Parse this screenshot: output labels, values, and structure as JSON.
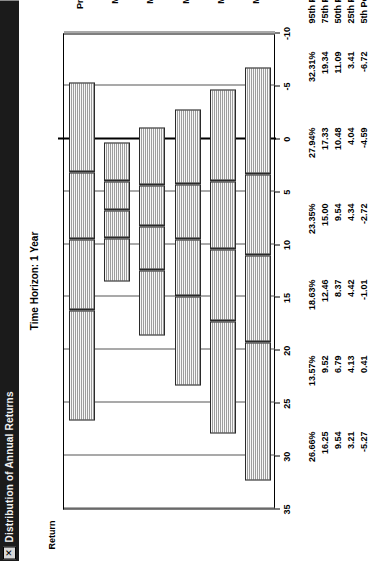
{
  "window": {
    "title": "Distribution of Annual Returns",
    "close_label": "✕",
    "close_icon": "close-icon"
  },
  "chart_data": {
    "type": "box",
    "title": "Time Horizon: 1 Year",
    "xlabel": "",
    "ylabel": "Return",
    "ylim": [
      -10,
      35
    ],
    "yticks": [
      "35",
      "30",
      "25",
      "20",
      "15",
      "10",
      "5",
      "0",
      "-5",
      "-10"
    ],
    "ytick_values": [
      35,
      30,
      25,
      20,
      15,
      10,
      5,
      0,
      -5,
      -10
    ],
    "grid": true,
    "legend": "none",
    "categories": [
      "Present",
      "Mix 1",
      "Mix 2",
      "Mix 3",
      "Mix 4",
      "Mix 5"
    ],
    "percentile_labels": [
      "95th Pctl",
      "75th Pctl",
      "50th Pctl",
      "25th Pctl",
      "5th Pctl"
    ],
    "series": [
      {
        "name": "95th Pctl",
        "values": [
          26.66,
          13.57,
          18.63,
          23.35,
          27.94,
          32.31
        ]
      },
      {
        "name": "75th Pctl",
        "values": [
          16.25,
          9.52,
          12.46,
          15.0,
          17.33,
          19.34
        ]
      },
      {
        "name": "50th Pctl",
        "values": [
          9.54,
          6.79,
          8.37,
          9.54,
          10.48,
          11.09
        ]
      },
      {
        "name": "25th Pctl",
        "values": [
          3.21,
          4.13,
          4.42,
          4.34,
          4.04,
          3.41
        ]
      },
      {
        "name": "5th Pctl",
        "values": [
          -5.27,
          0.41,
          -1.01,
          -2.72,
          -4.59,
          -6.72
        ]
      }
    ]
  },
  "table": {
    "columns": [
      "Present",
      "Mix 1",
      "Mix 2",
      "Mix 3",
      "Mix 4",
      "Mix 5"
    ],
    "row_labels": [
      "95th Pctl",
      "75th Pctl",
      "50th Pctl",
      "25th Pctl",
      "5th Pctl"
    ],
    "rows": [
      [
        "26.66%",
        "13.57%",
        "18.63%",
        "23.35%",
        "27.94%",
        "32.31%"
      ],
      [
        "16.25",
        "9.52",
        "12.46",
        "15.00",
        "17.33",
        "19.34"
      ],
      [
        "9.54",
        "6.79",
        "8.37",
        "9.54",
        "10.48",
        "11.09"
      ],
      [
        "3.21",
        "4.13",
        "4.42",
        "4.34",
        "4.04",
        "3.41"
      ],
      [
        "-5.27",
        "0.41",
        "-1.01",
        "-2.72",
        "-4.59",
        "-6.72"
      ]
    ]
  },
  "colors": {
    "titlebar_bg": "#1b1b1b",
    "box_fill": "#c9c9c9",
    "box_border": "#2a2a2a",
    "axis": "#000000"
  }
}
